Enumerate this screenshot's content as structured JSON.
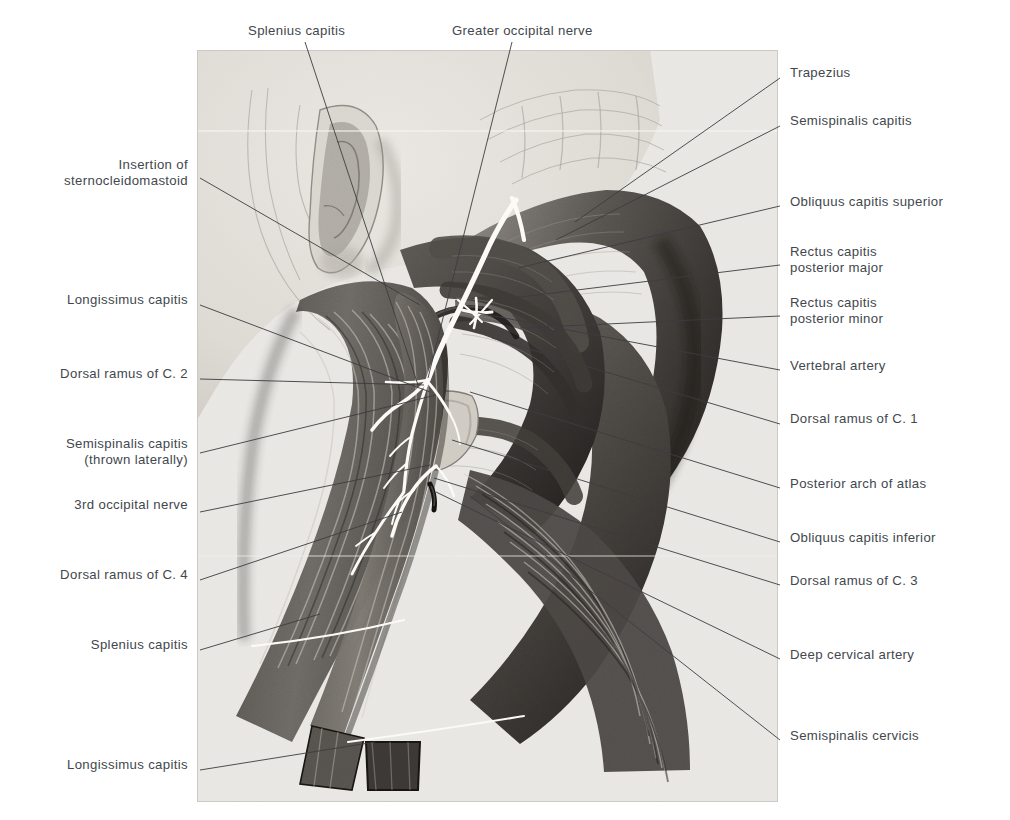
{
  "figure": {
    "caption": "",
    "panel": {
      "x": 197,
      "y": 50,
      "width": 581,
      "height": 752,
      "background": "#e9e7e3",
      "border": "#d2cfc9"
    }
  },
  "colors": {
    "label_text": "#42474d",
    "leader_line": "#35383c",
    "panel_background": "#e9e7e3",
    "muscle_mid": "#6e6a66",
    "muscle_dark": "#3f3c39",
    "muscle_darkest": "#24221f",
    "skin_light": "#dedbd6",
    "nerve_white": "#fbfaf7",
    "bone_pale": "#cfcbc4"
  },
  "labels": {
    "top": [
      {
        "id": "splenius-capitis-top",
        "text": "Splenius capitis",
        "x": 248,
        "y": 31,
        "anchor": "start"
      },
      {
        "id": "greater-occipital-nerve",
        "text": "Greater occipital nerve",
        "x": 452,
        "y": 31,
        "anchor": "start"
      }
    ],
    "left": [
      {
        "id": "insertion-of-sternocleidomastoid",
        "text": "Insertion of\nsternocleidomastoid",
        "x": 188,
        "y": 165
      },
      {
        "id": "longissimus-capitis-upper",
        "text": "Longissimus capitis",
        "x": 188,
        "y": 300
      },
      {
        "id": "dorsal-ramus-of-c2",
        "text": "Dorsal ramus of C. 2",
        "x": 188,
        "y": 374
      },
      {
        "id": "semispinalis-capitis-thrown",
        "text": "Semispinalis capitis\n(thrown laterally)",
        "x": 188,
        "y": 444
      },
      {
        "id": "third-occipital-nerve",
        "text": "3rd occipital nerve",
        "x": 188,
        "y": 505
      },
      {
        "id": "dorsal-ramus-of-c4",
        "text": "Dorsal ramus of C. 4",
        "x": 188,
        "y": 575
      },
      {
        "id": "splenius-capitis-lower",
        "text": "Splenius capitis",
        "x": 188,
        "y": 645
      },
      {
        "id": "longissimus-capitis-lower",
        "text": "Longissimus capitis",
        "x": 188,
        "y": 765
      }
    ],
    "right": [
      {
        "id": "trapezius",
        "text": "Trapezius",
        "x": 790,
        "y": 73
      },
      {
        "id": "semispinalis-capitis-right",
        "text": "Semispinalis capitis",
        "x": 790,
        "y": 121
      },
      {
        "id": "obliquus-capitis-superior",
        "text": "Obliquus capitis superior",
        "x": 790,
        "y": 202
      },
      {
        "id": "rectus-capitis-posterior-major",
        "text": "Rectus capitis\nposterior major",
        "x": 790,
        "y": 252
      },
      {
        "id": "rectus-capitis-posterior-minor",
        "text": "Rectus capitis\nposterior minor",
        "x": 790,
        "y": 303
      },
      {
        "id": "vertebral-artery",
        "text": "Vertebral artery",
        "x": 790,
        "y": 366
      },
      {
        "id": "dorsal-ramus-of-c1",
        "text": "Dorsal ramus of C. 1",
        "x": 790,
        "y": 419
      },
      {
        "id": "posterior-arch-of-atlas",
        "text": "Posterior arch of atlas",
        "x": 790,
        "y": 484
      },
      {
        "id": "obliquus-capitis-inferior",
        "text": "Obliquus capitis inferior",
        "x": 790,
        "y": 538
      },
      {
        "id": "dorsal-ramus-of-c3",
        "text": "Dorsal ramus of C. 3",
        "x": 790,
        "y": 581
      },
      {
        "id": "deep-cervical-artery",
        "text": "Deep cervical artery",
        "x": 790,
        "y": 655
      },
      {
        "id": "semispinalis-cervicis",
        "text": "Semispinalis cervicis",
        "x": 790,
        "y": 736
      }
    ]
  },
  "leaders": {
    "top": [
      {
        "id": "leader-splenius-capitis-top",
        "points": "305,42 418,385"
      },
      {
        "id": "leader-greater-occipital-nerve",
        "points": "512,42 428,378"
      }
    ],
    "left": [
      {
        "id": "leader-insertion-of-sternocleidomastoid",
        "points": "200,178 420,305"
      },
      {
        "id": "leader-longissimus-capitis-upper",
        "points": "200,305 430,392"
      },
      {
        "id": "leader-dorsal-ramus-of-c2",
        "points": "200,379 424,385"
      },
      {
        "id": "leader-semispinalis-capitis-thrown",
        "points": "200,453 436,395"
      },
      {
        "id": "leader-third-occipital-nerve",
        "points": "200,512 430,465"
      },
      {
        "id": "leader-dorsal-ramus-of-c4",
        "points": "200,580 402,512"
      },
      {
        "id": "leader-splenius-capitis-lower",
        "points": "200,650 320,614"
      },
      {
        "id": "leader-longissimus-capitis-lower",
        "points": "200,770 375,742"
      }
    ],
    "right": [
      {
        "id": "leader-trapezius",
        "points": "780,78 575,222"
      },
      {
        "id": "leader-semispinalis-capitis-right",
        "points": "780,126 556,240"
      },
      {
        "id": "leader-obliquus-capitis-superior",
        "points": "780,206 518,268"
      },
      {
        "id": "leader-rectus-capitis-posterior-major",
        "points": "780,265 512,298"
      },
      {
        "id": "leader-rectus-capitis-posterior-minor",
        "points": "780,316 520,328"
      },
      {
        "id": "leader-vertebral-artery",
        "points": "780,370 478,313"
      },
      {
        "id": "leader-dorsal-ramus-of-c1",
        "points": "780,424 492,338"
      },
      {
        "id": "leader-posterior-arch-of-atlas",
        "points": "780,488 470,392"
      },
      {
        "id": "leader-obliquus-capitis-inferior",
        "points": "780,542 452,440"
      },
      {
        "id": "leader-dorsal-ramus-of-c3",
        "points": "780,585 434,478"
      },
      {
        "id": "leader-deep-cervical-artery",
        "points": "780,659 436,492"
      },
      {
        "id": "leader-semispinalis-cervicis",
        "points": "780,740 470,496"
      }
    ]
  }
}
